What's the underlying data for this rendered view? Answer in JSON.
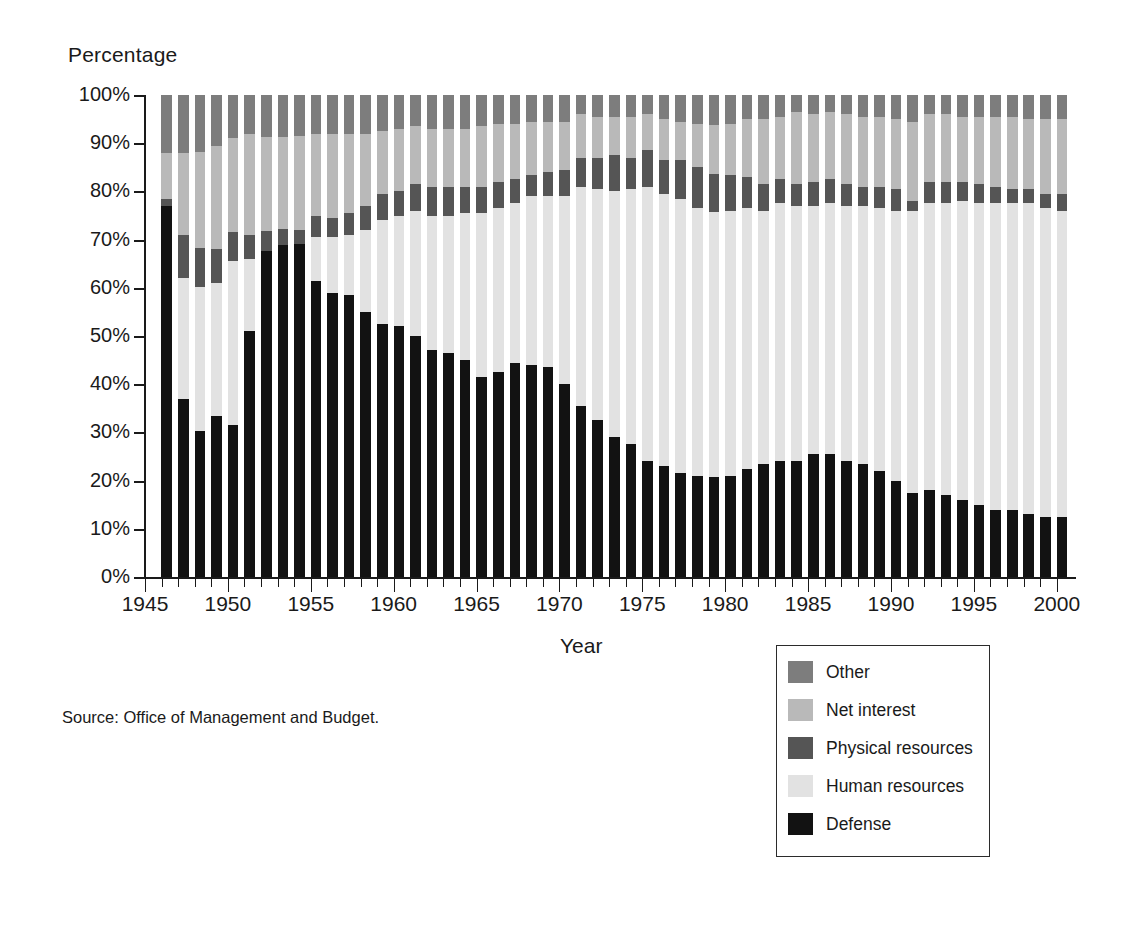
{
  "figure": {
    "y_axis_title": "Percentage",
    "x_axis_title": "Year",
    "source_note": "Source:  Office of Management and Budget."
  },
  "legend": {
    "items": [
      {
        "label": "Other",
        "color": "#7d7d7d"
      },
      {
        "label": "Net interest",
        "color": "#b9b9b9"
      },
      {
        "label": "Physical resources",
        "color": "#555555"
      },
      {
        "label": "Human resources",
        "color": "#e2e2e2"
      },
      {
        "label": "Defense",
        "color": "#121212"
      }
    ]
  },
  "chart_data": {
    "type": "bar",
    "stacked": true,
    "title": "",
    "xlabel": "Year",
    "ylabel": "Percentage",
    "ylim": [
      0,
      100
    ],
    "ytick_labels": [
      "100%",
      "90%",
      "80%",
      "70%",
      "60%",
      "50%",
      "40%",
      "30%",
      "20%",
      "10%",
      "0%"
    ],
    "ytick_values": [
      100,
      90,
      80,
      70,
      60,
      50,
      40,
      30,
      20,
      10,
      0
    ],
    "xtick_labels": [
      "1945",
      "1950",
      "1955",
      "1960",
      "1965",
      "1970",
      "1975",
      "1980",
      "1985",
      "1990",
      "1995",
      "2000"
    ],
    "xtick_values": [
      1945,
      1950,
      1955,
      1960,
      1965,
      1970,
      1975,
      1980,
      1985,
      1990,
      1995,
      2000
    ],
    "grid": false,
    "legend_position": "bottom-right",
    "x": [
      1946,
      1947,
      1948,
      1949,
      1950,
      1951,
      1952,
      1953,
      1954,
      1955,
      1956,
      1957,
      1958,
      1959,
      1960,
      1961,
      1962,
      1963,
      1964,
      1965,
      1966,
      1967,
      1968,
      1969,
      1970,
      1971,
      1972,
      1973,
      1974,
      1975,
      1976,
      1977,
      1978,
      1979,
      1980,
      1981,
      1982,
      1983,
      1984,
      1985,
      1986,
      1987,
      1988,
      1989,
      1990,
      1991,
      1992,
      1993,
      1994,
      1995,
      1996,
      1997,
      1998,
      1999,
      2000
    ],
    "series": [
      {
        "name": "Defense",
        "color": "#121212",
        "values": [
          77.0,
          37.0,
          30.2,
          33.5,
          31.5,
          51.0,
          67.7,
          68.8,
          69.0,
          61.5,
          59.0,
          58.5,
          55.0,
          52.5,
          52.0,
          50.0,
          47.0,
          46.5,
          45.0,
          41.5,
          42.5,
          44.5,
          44.0,
          43.5,
          40.0,
          35.5,
          32.5,
          29.0,
          27.5,
          24.0,
          23.0,
          21.5,
          21.0,
          20.7,
          21.0,
          22.5,
          23.5,
          24.0,
          24.0,
          25.5,
          25.5,
          24.0,
          23.5,
          22.0,
          20.0,
          17.5,
          18.0,
          17.0,
          16.0,
          15.0,
          14.0,
          14.0,
          13.0,
          12.5,
          12.5
        ]
      },
      {
        "name": "Human resources",
        "color": "#e2e2e2",
        "values": [
          0.0,
          25.0,
          30.0,
          27.5,
          34.0,
          15.0,
          0.0,
          0.0,
          0.0,
          9.0,
          11.5,
          12.5,
          17.0,
          21.5,
          23.0,
          26.0,
          28.0,
          28.5,
          30.5,
          34.0,
          34.0,
          33.0,
          35.0,
          35.5,
          39.0,
          45.5,
          48.0,
          51.0,
          53.0,
          57.0,
          56.5,
          57.0,
          55.5,
          55.0,
          55.0,
          54.0,
          52.5,
          53.5,
          53.0,
          51.5,
          52.0,
          53.0,
          53.5,
          54.5,
          56.0,
          58.5,
          59.5,
          60.5,
          62.0,
          62.5,
          63.5,
          63.5,
          64.5,
          64.0,
          63.5
        ]
      },
      {
        "name": "Physical resources",
        "color": "#555555",
        "values": [
          1.5,
          9.0,
          8.0,
          7.0,
          6.0,
          5.0,
          4.0,
          3.5,
          3.0,
          4.5,
          4.0,
          4.5,
          5.0,
          5.5,
          5.0,
          5.5,
          6.0,
          6.0,
          5.5,
          5.5,
          5.5,
          5.0,
          4.5,
          5.0,
          5.5,
          6.0,
          6.5,
          7.5,
          6.5,
          7.5,
          7.0,
          8.0,
          8.5,
          8.0,
          7.5,
          6.5,
          5.5,
          5.0,
          4.5,
          5.0,
          5.0,
          4.5,
          4.0,
          4.5,
          4.5,
          2.0,
          4.5,
          4.5,
          4.0,
          4.0,
          3.5,
          3.0,
          3.0,
          3.0,
          3.5
        ]
      },
      {
        "name": "Net interest",
        "color": "#b9b9b9",
        "values": [
          9.5,
          17.0,
          20.0,
          21.5,
          19.5,
          21.0,
          19.5,
          19.0,
          19.5,
          17.0,
          17.5,
          16.5,
          15.0,
          13.0,
          13.0,
          12.0,
          12.0,
          12.0,
          12.0,
          12.5,
          12.0,
          11.5,
          11.0,
          10.5,
          10.0,
          9.0,
          8.5,
          8.0,
          8.5,
          7.5,
          8.5,
          8.0,
          9.0,
          10.0,
          10.5,
          12.0,
          13.5,
          13.0,
          15.0,
          14.0,
          14.0,
          14.5,
          14.5,
          14.5,
          14.5,
          16.5,
          14.0,
          14.0,
          13.5,
          14.0,
          14.5,
          15.0,
          14.5,
          15.5,
          15.5
        ]
      },
      {
        "name": "Other",
        "color": "#7d7d7d",
        "values": [
          12.0,
          12.0,
          11.8,
          10.5,
          9.0,
          8.0,
          8.8,
          8.7,
          8.5,
          8.0,
          8.0,
          8.0,
          8.0,
          7.5,
          7.0,
          6.5,
          7.0,
          7.0,
          7.0,
          6.5,
          6.0,
          6.0,
          5.5,
          5.5,
          5.5,
          4.0,
          4.5,
          4.5,
          4.5,
          4.0,
          5.0,
          5.5,
          6.0,
          6.3,
          6.0,
          5.0,
          5.0,
          4.5,
          3.5,
          4.0,
          3.5,
          4.0,
          4.5,
          4.5,
          5.0,
          5.5,
          4.0,
          4.0,
          4.5,
          4.5,
          4.5,
          4.5,
          5.0,
          5.0,
          5.0
        ]
      }
    ]
  }
}
